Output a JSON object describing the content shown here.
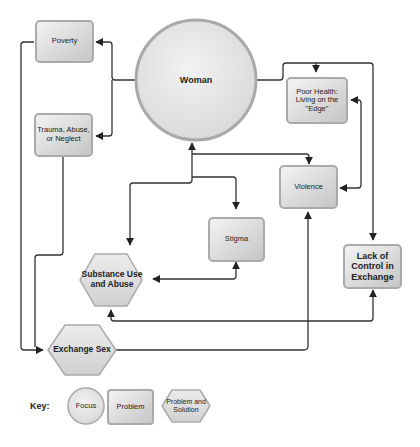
{
  "nodes": {
    "woman": {
      "label": "Woman",
      "shape": "circle"
    },
    "poverty": {
      "label": "Poverty",
      "shape": "rect"
    },
    "trauma": {
      "label": "Trauma, Abuse,\nor Neglect",
      "shape": "rect"
    },
    "poor_health": {
      "label": "Poor Health:\nLiving on the\n\"Edge\"",
      "shape": "rect"
    },
    "violence": {
      "label": "Violence",
      "shape": "rect"
    },
    "stigma": {
      "label": "Stigma",
      "shape": "rect"
    },
    "lack_control": {
      "label": "Lack of\nControl in\nExchange",
      "shape": "rect"
    },
    "substance": {
      "label": "Substance Use\nand Abuse",
      "shape": "hexagon"
    },
    "exchange_sex": {
      "label": "Exchange Sex",
      "shape": "hexagon"
    }
  },
  "edges": [
    {
      "from": "woman",
      "to": "poverty"
    },
    {
      "from": "woman",
      "to": "trauma"
    },
    {
      "from": "woman",
      "to": "poor_health"
    },
    {
      "from": "woman",
      "to": "lack_control"
    },
    {
      "from": "poor_health",
      "to": "violence",
      "bidirectional": true
    },
    {
      "from": "woman",
      "to": "violence"
    },
    {
      "from": "woman",
      "to": "stigma"
    },
    {
      "from": "woman",
      "to": "substance",
      "bidirectional": true
    },
    {
      "from": "stigma",
      "to": "substance",
      "bidirectional": true
    },
    {
      "from": "lack_control",
      "to": "substance",
      "bidirectional": true
    },
    {
      "from": "poverty",
      "to": "exchange_sex"
    },
    {
      "from": "trauma",
      "to": "exchange_sex"
    },
    {
      "from": "exchange_sex",
      "to": "violence"
    }
  ],
  "key": {
    "title": "Key:",
    "focus": "Focus",
    "problem": "Problem",
    "problem_solution": "Problem and\nSolution"
  },
  "colors": {
    "shape_fill_light": "#ececec",
    "shape_fill_dark": "#c8c8c8",
    "shape_border": "#a8a8a8",
    "line": "#333333"
  }
}
